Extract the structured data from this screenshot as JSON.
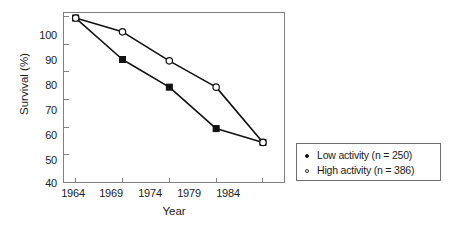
{
  "chart_data": {
    "type": "line",
    "title": "",
    "xlabel": "Year",
    "ylabel": "Survival (%)",
    "x": [
      1964,
      1969,
      1974,
      1979,
      1984
    ],
    "categories": [
      "1964",
      "1969",
      "1974",
      "1979",
      "1984"
    ],
    "xlim": [
      1962.7,
      1986.3
    ],
    "ylim": [
      40,
      101.5
    ],
    "xticks": [
      "1964",
      "1969",
      "1974",
      "1979",
      "1984"
    ],
    "yticks": [
      "100",
      "90",
      "80",
      "70",
      "60",
      "50",
      "40"
    ],
    "grid": false,
    "legend_position": "right-outside",
    "series": [
      {
        "name": "Low activity (n = 250)",
        "marker": "filled-square",
        "color": "#111111",
        "values": [
          99.5,
          84.5,
          74.5,
          59.5,
          54.5
        ]
      },
      {
        "name": "High activity (n = 386)",
        "marker": "open-circle",
        "color": "#111111",
        "values": [
          99.5,
          94.5,
          84.0,
          74.5,
          54.5
        ]
      }
    ]
  },
  "legend": {
    "entries": [
      {
        "label": "Low activity (n = 250)",
        "marker": "filled-dot"
      },
      {
        "label": "High activity (n = 386)",
        "marker": "open-dot"
      }
    ]
  },
  "axes": {
    "y_title": "Survival (%)",
    "x_title": "Year",
    "y_tick_labels": [
      "100",
      "90",
      "80",
      "70",
      "60",
      "50",
      "40"
    ],
    "x_tick_labels": [
      "1964",
      "1969",
      "1974",
      "1979",
      "1984"
    ]
  },
  "colors": {
    "line": "#111111",
    "frame": "#808080",
    "text": "#1a1a1a",
    "background": "#ffffff"
  }
}
